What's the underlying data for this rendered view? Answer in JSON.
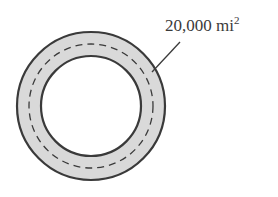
{
  "diagram": {
    "type": "annulus",
    "label": {
      "value": "20,000 mi",
      "exponent": "2"
    },
    "colors": {
      "ring_fill": "#d9d9d9",
      "stroke": "#3a3a3a",
      "background": "#ffffff"
    }
  }
}
